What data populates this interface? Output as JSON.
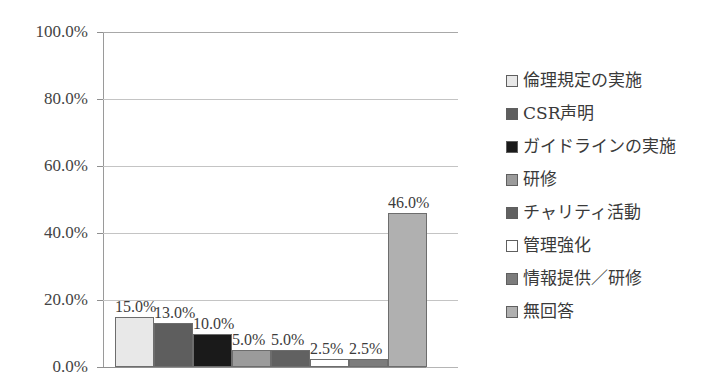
{
  "chart_data": {
    "type": "bar",
    "title": "",
    "xlabel": "",
    "ylabel": "",
    "ylim": [
      0,
      100
    ],
    "grid": true,
    "legend_position": "right",
    "categories": [
      "倫理規定の実施",
      "CSR声明",
      "ガイドラインの実施",
      "研修",
      "チャリティ活動",
      "管理強化",
      "情報提供／研修",
      "無回答"
    ],
    "values": [
      15.0,
      13.0,
      10.0,
      5.0,
      5.0,
      2.5,
      2.5,
      46.0
    ],
    "data_labels": [
      "15.0%",
      "13.0%",
      "10.0%",
      "5.0%",
      "5.0%",
      "2.5%",
      "2.5%",
      "46.0%"
    ],
    "colors": [
      "#e8e8e8",
      "#5e5e5e",
      "#1a1a1a",
      "#9b9b9b",
      "#616161",
      "#ffffff",
      "#7c7c7c",
      "#b0b0b0"
    ],
    "y_ticks": [
      0,
      20,
      40,
      60,
      80,
      100
    ],
    "y_tick_labels": [
      "0.0%",
      "20.0%",
      "40.0%",
      "60.0%",
      "80.0%",
      "100.0%"
    ]
  },
  "legend": {
    "items": [
      {
        "label": "倫理規定の実施",
        "color": "#e8e8e8"
      },
      {
        "label": "CSR声明",
        "color": "#5e5e5e"
      },
      {
        "label": "ガイドラインの実施",
        "color": "#1a1a1a"
      },
      {
        "label": "研修",
        "color": "#9b9b9b"
      },
      {
        "label": "チャリティ活動",
        "color": "#616161"
      },
      {
        "label": "管理強化",
        "color": "#ffffff"
      },
      {
        "label": "情報提供／研修",
        "color": "#7c7c7c"
      },
      {
        "label": "無回答",
        "color": "#b0b0b0"
      }
    ]
  }
}
